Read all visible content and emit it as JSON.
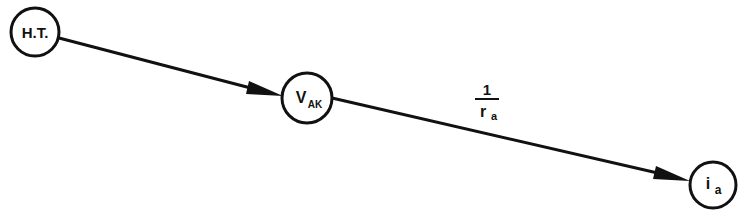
{
  "diagram": {
    "type": "signal-flow-graph",
    "nodes": [
      {
        "id": "ht",
        "label": "H.T.",
        "cx": 35,
        "cy": 32,
        "r": 24
      },
      {
        "id": "vak",
        "label_main": "V",
        "label_sub": "AK",
        "cx": 307,
        "cy": 98,
        "r": 25
      },
      {
        "id": "ia",
        "label_main": "i",
        "label_sub": "a",
        "cx": 713,
        "cy": 185,
        "r": 23
      }
    ],
    "edges": [
      {
        "from": "ht",
        "to": "vak",
        "gain": ""
      },
      {
        "from": "vak",
        "to": "ia",
        "gain_numerator": "1",
        "gain_denominator_main": "r",
        "gain_denominator_sub": "a"
      }
    ],
    "colors": {
      "stroke": "#111111",
      "background": "#ffffff"
    }
  }
}
